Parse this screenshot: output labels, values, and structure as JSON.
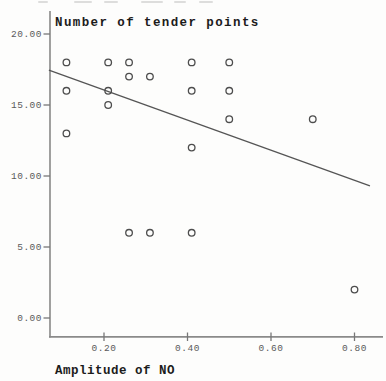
{
  "colors": {
    "background": "#fdfdfc",
    "title_text": "#1b1b1b",
    "tick_text": "#4a4a4a",
    "axis": "#777777",
    "x_axis_line": "#8a8a8a",
    "marker": "#4d4d4d",
    "regression_line": "#555555"
  },
  "chart_data": {
    "type": "scatter",
    "title": "Number of tender points",
    "xlabel": "Amplitude of NO",
    "ylabel": "Number of tender points",
    "xlim": [
      0.068,
      0.868
    ],
    "ylim": [
      -1.3,
      21.6
    ],
    "x_ticks": [
      0.2,
      0.4,
      0.6,
      0.8
    ],
    "y_ticks": [
      20.0,
      15.0,
      10.0,
      5.0,
      0.0
    ],
    "grid": false,
    "legend_position": "none",
    "marker_style": "open-circle",
    "points": [
      {
        "x": 0.11,
        "y": 18
      },
      {
        "x": 0.21,
        "y": 18
      },
      {
        "x": 0.26,
        "y": 18
      },
      {
        "x": 0.41,
        "y": 18
      },
      {
        "x": 0.5,
        "y": 18
      },
      {
        "x": 0.26,
        "y": 17
      },
      {
        "x": 0.31,
        "y": 17
      },
      {
        "x": 0.11,
        "y": 16
      },
      {
        "x": 0.21,
        "y": 16
      },
      {
        "x": 0.41,
        "y": 16
      },
      {
        "x": 0.5,
        "y": 16
      },
      {
        "x": 0.21,
        "y": 15
      },
      {
        "x": 0.5,
        "y": 14
      },
      {
        "x": 0.7,
        "y": 14
      },
      {
        "x": 0.11,
        "y": 13
      },
      {
        "x": 0.41,
        "y": 12
      },
      {
        "x": 0.26,
        "y": 6
      },
      {
        "x": 0.31,
        "y": 6
      },
      {
        "x": 0.41,
        "y": 6
      },
      {
        "x": 0.8,
        "y": 2
      }
    ],
    "regression_line": {
      "x1": 0.068,
      "y1": 17.45,
      "x2": 0.837,
      "y2": 9.3
    }
  }
}
